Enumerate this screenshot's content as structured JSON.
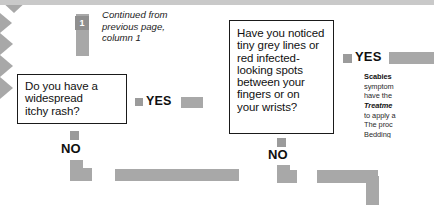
{
  "chart_data": {
    "type": "diagram",
    "nodes": [
      {
        "id": "entry",
        "type": "connector",
        "label": "1"
      },
      {
        "id": "q1",
        "type": "question",
        "text": "Do you have a widespread itchy rash?"
      },
      {
        "id": "q2",
        "type": "question",
        "text": "Have you noticed tiny grey lines or red infected-looking spots between your fingers or on your wrists?"
      },
      {
        "id": "outcome",
        "type": "outcome",
        "text": "Scabies"
      }
    ],
    "edges": [
      {
        "from": "q1",
        "to": "q2",
        "label": "YES"
      },
      {
        "from": "q1",
        "to": "next-page",
        "label": "NO"
      },
      {
        "from": "q2",
        "to": "outcome",
        "label": "YES"
      },
      {
        "from": "q2",
        "to": "next-page",
        "label": "NO"
      }
    ]
  },
  "caption": {
    "line1": "Continued from",
    "line2": "previous page,",
    "line3": "column 1"
  },
  "entry_marker": {
    "number": "1"
  },
  "box1": {
    "line1": "Do you have a",
    "line2": "widespread",
    "line3": "itchy rash?"
  },
  "box2": {
    "line1": "Have you noticed",
    "line2": "tiny grey lines or",
    "line3": "red infected-",
    "line4": "looking spots",
    "line5": "between your",
    "line6": "fingers or on",
    "line7": "your wrists?"
  },
  "labels": {
    "yes1": "YES",
    "yes2": "YES",
    "no1": "NO",
    "no2": "NO"
  },
  "info_panel": {
    "heading": "Scabies",
    "line1": "symptom",
    "line2": "have the",
    "treatment_heading": "Treatme",
    "line3": "to apply a",
    "line4": "The proc",
    "line5": "Bedding",
    "line6": "laundere"
  },
  "colors": {
    "arrow": "#a8a8a8",
    "marker": "#9b9b9b",
    "box_border": "#1a1a1a",
    "text": "#111111"
  }
}
